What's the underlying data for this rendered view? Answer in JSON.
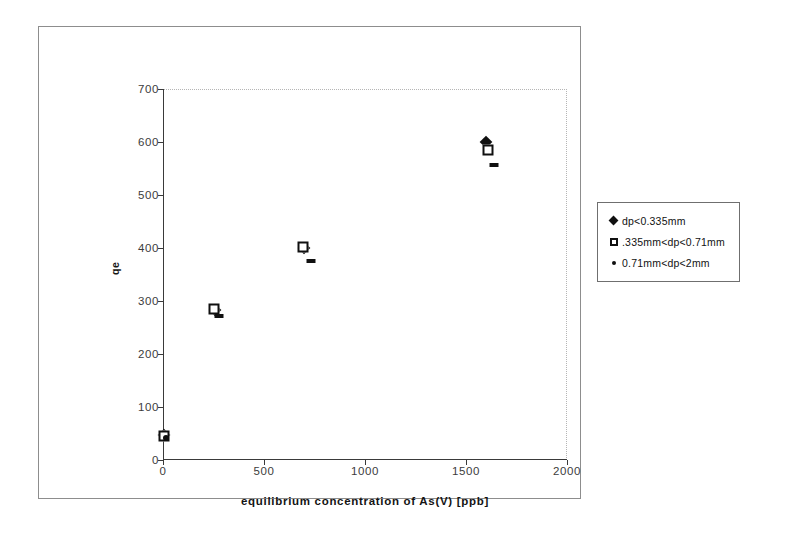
{
  "chart_data": {
    "type": "scatter",
    "title": "",
    "xlabel": "equilibrium concentration of As(V) [ppb]",
    "ylabel": "qe",
    "xlim": [
      0,
      2000
    ],
    "ylim": [
      0,
      700
    ],
    "xticks": [
      "0",
      "500",
      "1000",
      "1500",
      "2000"
    ],
    "yticks": [
      "0",
      "100",
      "200",
      "300",
      "400",
      "500",
      "600",
      "700"
    ],
    "grid": false,
    "legend_position": "right",
    "series": [
      {
        "name": "dp<0.335mm",
        "marker": "filled-diamond",
        "color": "#101010",
        "points": [
          {
            "x": 5,
            "y": 48
          },
          {
            "x": 255,
            "y": 283
          },
          {
            "x": 700,
            "y": 400
          },
          {
            "x": 1600,
            "y": 600
          }
        ]
      },
      {
        "name": ".335mm<dp<0.71mm",
        "marker": "open-square",
        "color": "#101010",
        "points": [
          {
            "x": 5,
            "y": 45
          },
          {
            "x": 250,
            "y": 285
          },
          {
            "x": 695,
            "y": 402
          },
          {
            "x": 1610,
            "y": 585
          }
        ]
      },
      {
        "name": "0.71mm<dp<2mm",
        "marker": "small-dot",
        "color": "#101010",
        "points": [
          {
            "x": 15,
            "y": 42
          },
          {
            "x": 275,
            "y": 272
          },
          {
            "x": 735,
            "y": 375
          },
          {
            "x": 1640,
            "y": 557
          }
        ]
      }
    ]
  },
  "legend": {
    "entries": [
      {
        "label": "dp<0.335mm",
        "key": "diamond"
      },
      {
        "label": ".335mm<dp<0.71mm",
        "key": "square"
      },
      {
        "label": "0.71mm<dp<2mm",
        "key": "dot"
      }
    ]
  }
}
